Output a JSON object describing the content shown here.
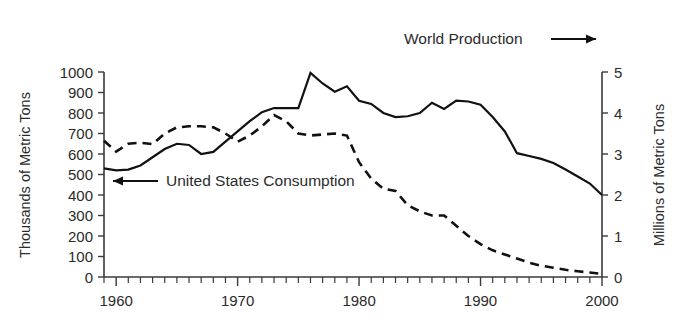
{
  "chart_data": {
    "type": "line",
    "title": "",
    "subtitle": "",
    "xlabel": "",
    "ylabel": "Thousands of Metric Tons",
    "y2label": "Millions of Metric Tons",
    "xlim": [
      1959,
      2000
    ],
    "ylim": [
      0,
      1000
    ],
    "y2lim": [
      0,
      5
    ],
    "grid": false,
    "legend_position": "inside-plot",
    "xticks": [
      1960,
      1970,
      1980,
      1990,
      2000
    ],
    "xticklabels": [
      "1960",
      "1970",
      "1980",
      "1990",
      "2000"
    ],
    "x_minor_tick_interval": 1,
    "yticks": [
      0,
      100,
      200,
      300,
      400,
      500,
      600,
      700,
      800,
      900,
      1000
    ],
    "yticklabels": [
      "0",
      "100",
      "200",
      "300",
      "400",
      "500",
      "600",
      "700",
      "800",
      "900",
      "1000"
    ],
    "y2ticks": [
      0,
      1,
      2,
      3,
      4,
      5
    ],
    "y2ticklabels": [
      "0",
      "1",
      "2",
      "3",
      "4",
      "5"
    ],
    "x": [
      1959,
      1960,
      1961,
      1962,
      1963,
      1964,
      1965,
      1966,
      1967,
      1968,
      1969,
      1970,
      1971,
      1972,
      1973,
      1974,
      1975,
      1976,
      1977,
      1978,
      1979,
      1980,
      1981,
      1982,
      1983,
      1984,
      1985,
      1986,
      1987,
      1988,
      1989,
      1990,
      1991,
      1992,
      1993,
      1994,
      1995,
      1996,
      1997,
      1998,
      1999,
      2000
    ],
    "series": [
      {
        "name": "World Production",
        "axis": "right",
        "units": "Millions of Metric Tons",
        "style": "solid",
        "color": "#111111",
        "values": [
          2.65,
          2.6,
          2.62,
          2.72,
          2.92,
          3.12,
          3.25,
          3.22,
          3.0,
          3.05,
          3.3,
          3.55,
          3.8,
          4.02,
          4.12,
          4.12,
          4.12,
          4.98,
          4.72,
          4.52,
          4.65,
          4.3,
          4.22,
          4.0,
          3.9,
          3.92,
          4.0,
          4.25,
          4.1,
          4.3,
          4.28,
          4.2,
          3.9,
          3.55,
          3.02,
          2.95,
          2.88,
          2.78,
          2.62,
          2.45,
          2.28,
          2.0
        ]
      },
      {
        "name": "United States Consumption",
        "axis": "left",
        "units": "Thousands of Metric Tons",
        "style": "dashed",
        "color": "#111111",
        "values": [
          665,
          612,
          650,
          655,
          648,
          700,
          730,
          735,
          735,
          730,
          700,
          660,
          690,
          735,
          790,
          760,
          700,
          690,
          695,
          700,
          690,
          560,
          480,
          430,
          420,
          350,
          320,
          300,
          300,
          250,
          200,
          160,
          130,
          110,
          90,
          70,
          55,
          45,
          35,
          28,
          22,
          15
        ]
      }
    ],
    "annotations": [
      {
        "name": "world-production-legend",
        "text": "World Production",
        "marker": "solid-line-right"
      },
      {
        "name": "us-consumption-legend",
        "text": "United States Consumption",
        "marker": "solid-line-left"
      }
    ]
  },
  "legend": {
    "world_production": "World Production",
    "us_consumption": "United States Consumption"
  },
  "axes": {
    "left_title": "Thousands of Metric Tons",
    "right_title": "Millions of Metric Tons"
  },
  "colors": {
    "ink": "#111111",
    "axis": "#3a3a3a",
    "text": "#2b2b2b",
    "background": "#ffffff"
  }
}
